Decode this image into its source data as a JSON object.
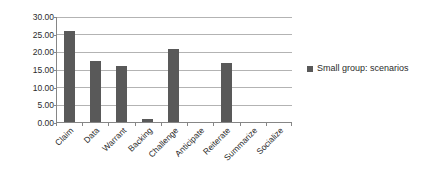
{
  "chart_data": {
    "type": "bar",
    "title": "",
    "subtitle": "",
    "xlabel": "",
    "ylabel": "",
    "ylim": [
      0,
      30
    ],
    "ytick_step": 5,
    "ytick_labels": [
      "0.00",
      "5.00",
      "10.00",
      "15.00",
      "20.00",
      "25.00",
      "30.00"
    ],
    "grid": true,
    "legend_position": "right",
    "categories": [
      "Claim",
      "Data",
      "Warrant",
      "Backing",
      "Challenge",
      "Anticipate",
      "Reiterate",
      "Summarize",
      "Socialize"
    ],
    "series": [
      {
        "name": "Small group: scenarios",
        "color": "#595959",
        "values": [
          26.0,
          17.3,
          16.0,
          1.0,
          21.0,
          0.0,
          17.0,
          0.0,
          0.0
        ]
      }
    ]
  },
  "legend": {
    "entries": [
      {
        "label": "Small group: scenarios",
        "color": "#595959"
      }
    ]
  },
  "colors": {
    "bar": "#595959",
    "gridline": "#b3b3b3",
    "axis": "#868686",
    "text": "#2b2b2b",
    "background": "#ffffff"
  }
}
